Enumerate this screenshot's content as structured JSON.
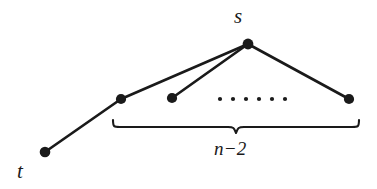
{
  "figure": {
    "type": "graph-diagram",
    "background_color": "#ffffff",
    "stroke_color": "#1a1a1a",
    "labels": {
      "source": "s",
      "sink": "t",
      "brace_label": "n−2"
    },
    "nodes": [
      {
        "id": "s",
        "name": "apex-node",
        "x": 248,
        "y": 44,
        "r": 5.2,
        "label": "s"
      },
      {
        "id": "v1",
        "name": "left-leaf-node",
        "x": 121,
        "y": 99,
        "r": 5.0,
        "label": ""
      },
      {
        "id": "v2",
        "name": "second-leaf-node",
        "x": 172,
        "y": 98,
        "r": 5.0,
        "label": ""
      },
      {
        "id": "vn",
        "name": "right-leaf-node",
        "x": 349,
        "y": 99,
        "r": 5.0,
        "label": ""
      },
      {
        "id": "t",
        "name": "sink-node",
        "x": 45,
        "y": 152,
        "r": 5.2,
        "label": "t"
      }
    ],
    "edges": [
      {
        "name": "edge-s-v1",
        "from": "s",
        "to": "v1",
        "width": 2.6
      },
      {
        "name": "edge-s-v2",
        "from": "s",
        "to": "v2",
        "width": 2.6
      },
      {
        "name": "edge-s-vn",
        "from": "s",
        "to": "vn",
        "width": 2.6
      },
      {
        "name": "edge-v1-t",
        "from": "v1",
        "to": "t",
        "width": 2.6
      }
    ],
    "ellipsis": {
      "name": "ellipsis-dots",
      "count": 6,
      "x_start": 220,
      "x_end": 285,
      "y": 99,
      "r": 2.1
    },
    "brace": {
      "name": "underbrace",
      "x_left": 113,
      "x_right": 359,
      "y_top": 121,
      "y_tip": 134,
      "width": 2.0
    }
  }
}
